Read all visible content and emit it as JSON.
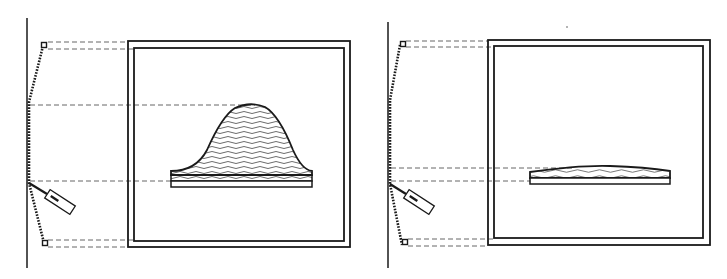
{
  "figure": {
    "background": "#ffffff",
    "stroke_color": "#1a1a1a",
    "dash_color": "#555555",
    "panels": [
      {
        "id": "left",
        "description": "Dome-shaped (bell) object on base plate inside double frame, with tilted sensor on wall",
        "object_shape": "bell-dome"
      },
      {
        "id": "right",
        "description": "Flat lens-shaped object on base plate inside double frame, with tilted sensor on wall",
        "object_shape": "flat-lens"
      }
    ]
  }
}
